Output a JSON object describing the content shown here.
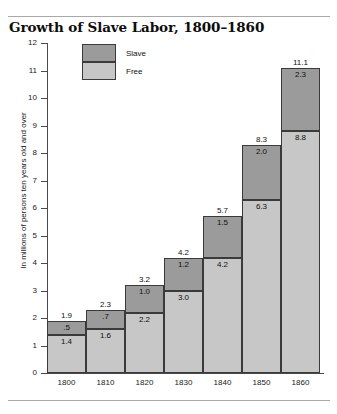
{
  "chart_data": {
    "type": "bar",
    "subtype": "stacked-vertical",
    "title": "Growth of Slave Labor, 1800–1860",
    "xlabel": "",
    "ylabel": "In millions of persons ten years old and over",
    "ylim": [
      0,
      12
    ],
    "ytick_labels": [
      "12",
      "11",
      "10",
      "9",
      "8",
      "7",
      "6",
      "5",
      "4",
      "3",
      "2",
      "1",
      "0"
    ],
    "ytick_values": [
      12,
      11,
      10,
      9,
      8,
      7,
      6,
      5,
      4,
      3,
      2,
      1,
      0
    ],
    "grid": false,
    "legend_position": "top-left-inside",
    "categories": [
      "1800",
      "1810",
      "1820",
      "1830",
      "1840",
      "1850",
      "1860"
    ],
    "series": [
      {
        "name": "Free",
        "color": "#c7c7c7",
        "values": [
          1.4,
          1.6,
          2.2,
          3.0,
          4.2,
          6.3,
          8.8
        ],
        "value_labels": [
          "1.4",
          "1.6",
          "2.2",
          "3.0",
          "4.2",
          "6.3",
          "8.8"
        ]
      },
      {
        "name": "Slave",
        "color": "#9b9b9b",
        "values": [
          0.5,
          0.7,
          1.0,
          1.2,
          1.5,
          2.0,
          2.3
        ],
        "value_labels": [
          ".5",
          ".7",
          "1.0",
          "1.2",
          "1.5",
          "2.0",
          "2.3"
        ]
      }
    ],
    "totals": [
      1.9,
      2.3,
      3.2,
      4.2,
      5.7,
      8.3,
      11.1
    ],
    "total_labels": [
      "1.9",
      "2.3",
      "3.2",
      "4.2",
      "5.7",
      "8.3",
      "11.1"
    ]
  },
  "legend": {
    "items": [
      {
        "label": "Slave",
        "color": "#9b9b9b"
      },
      {
        "label": "Free",
        "color": "#c7c7c7"
      }
    ]
  }
}
